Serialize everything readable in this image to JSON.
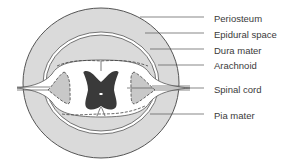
{
  "diagram": {
    "labels": [
      {
        "id": "periosteum",
        "text": "Periosteum",
        "y": 13
      },
      {
        "id": "epidural-space",
        "text": "Epidural space",
        "y": 29
      },
      {
        "id": "dura-mater",
        "text": "Dura mater",
        "y": 45
      },
      {
        "id": "arachnoid",
        "text": "Arachnoid",
        "y": 60
      },
      {
        "id": "spinal-cord",
        "text": "Spinal cord",
        "y": 84
      },
      {
        "id": "pia-mater",
        "text": "Pia mater",
        "y": 110
      }
    ],
    "colors": {
      "bone_fill": "#d9d9d9",
      "outline": "#555555",
      "grey_matter": "#3a3a3a",
      "white_matter": "#ffffff",
      "ganglion_fill": "#c8c8c8",
      "leader_line": "#555555"
    }
  }
}
